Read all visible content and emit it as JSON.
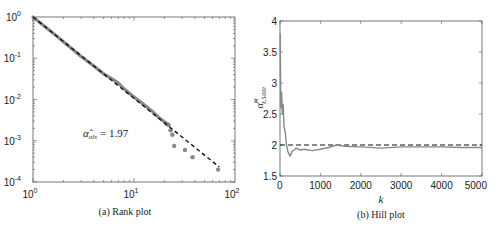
{
  "chart_data": [
    {
      "type": "scatter",
      "title": "",
      "caption": "(a) Rank plot",
      "xscale": "log",
      "yscale": "log",
      "xlim": [
        1,
        100
      ],
      "ylim": [
        0.0001,
        1
      ],
      "xticks": [
        "10^0",
        "10^1",
        "10^2"
      ],
      "yticks": [
        "10^0",
        "10^-1",
        "10^-2",
        "10^-3",
        "10^-4"
      ],
      "xlabel": "",
      "ylabel": "",
      "grid": false,
      "annotation": "α̂_ols = 1.97",
      "series": [
        {
          "name": "empirical",
          "style": "grey markers",
          "color": "#888888",
          "x": [
            1,
            1.2,
            1.5,
            2,
            3,
            4,
            5,
            6,
            7,
            8,
            10,
            12,
            15,
            18,
            21,
            22,
            23,
            24,
            25,
            32,
            38,
            68
          ],
          "y": [
            1,
            0.7,
            0.45,
            0.25,
            0.11,
            0.065,
            0.042,
            0.032,
            0.025,
            0.018,
            0.0115,
            0.0082,
            0.0053,
            0.0035,
            0.0026,
            0.0024,
            0.0018,
            0.0014,
            0.00075,
            0.0006,
            0.0004,
            0.0002
          ]
        },
        {
          "name": "OLS fit",
          "style": "black dashed",
          "color": "#111111",
          "slope": -1.97,
          "x": [
            1,
            70
          ],
          "y": [
            1,
            0.00023
          ]
        }
      ]
    },
    {
      "type": "line",
      "title": "",
      "caption": "(b) Hill plot",
      "xlim": [
        0,
        5000
      ],
      "ylim": [
        1.5,
        4
      ],
      "xticks": [
        "0",
        "1000",
        "2000",
        "3000",
        "4000",
        "5000"
      ],
      "yticks": [
        "1.5",
        "2",
        "2.5",
        "3",
        "3.5",
        "4"
      ],
      "xlabel": "k",
      "ylabel": "α̂^H_{k,5000}",
      "grid": false,
      "series": [
        {
          "name": "Hill estimator",
          "style": "grey solid",
          "color": "#888888",
          "x": [
            5,
            20,
            40,
            60,
            80,
            100,
            130,
            160,
            200,
            250,
            300,
            350,
            400,
            500,
            600,
            800,
            1000,
            1200,
            1400,
            1600,
            2000,
            2500,
            3000,
            3500,
            4000,
            4500,
            5000
          ],
          "y": [
            3.8,
            2.6,
            2.85,
            2.5,
            2.65,
            2.3,
            2.2,
            2.0,
            1.88,
            1.82,
            1.9,
            1.92,
            1.95,
            1.92,
            1.93,
            1.91,
            1.93,
            1.96,
            2.0,
            1.98,
            1.97,
            1.95,
            1.97,
            1.97,
            1.97,
            1.96,
            1.96
          ]
        },
        {
          "name": "reference α=2",
          "style": "black dashed",
          "color": "#111111",
          "x": [
            0,
            5000
          ],
          "y": [
            2,
            2
          ]
        }
      ]
    }
  ],
  "panels": {
    "a": {
      "caption": "(a) Rank plot",
      "annotation_symbol": "α̂",
      "annotation_sub": "ols",
      "annotation_value": "= 1.97",
      "xtick_base": "10",
      "xtick_exps": [
        "0",
        "1",
        "2"
      ],
      "ytick_exps": [
        "0",
        "-1",
        "-2",
        "-3",
        "-4"
      ]
    },
    "b": {
      "caption": "(b) Hill plot",
      "xlabel": "k",
      "ylabel_main": "α̂",
      "ylabel_sup": "H",
      "ylabel_sub": "k,5000",
      "xticks": [
        "0",
        "1000",
        "2000",
        "3000",
        "4000",
        "5000"
      ],
      "yticks": [
        "4",
        "3.5",
        "3",
        "2.5",
        "2",
        "1.5"
      ]
    }
  }
}
